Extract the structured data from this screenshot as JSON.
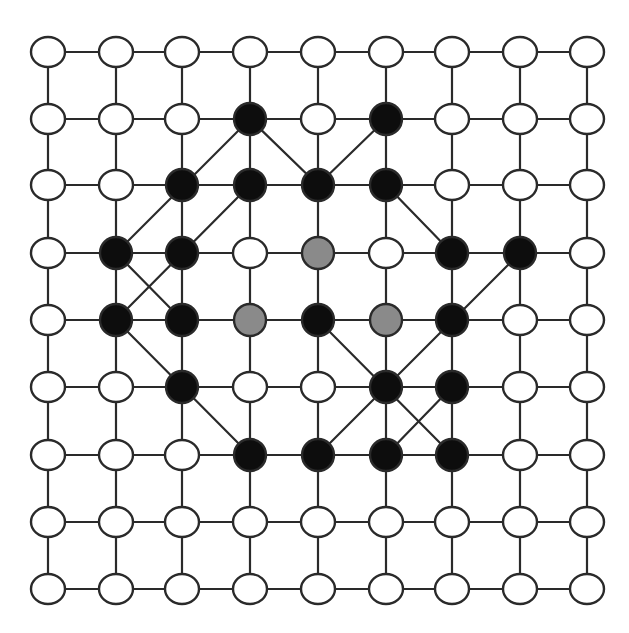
{
  "diagram": {
    "type": "grid-graph",
    "rows": 9,
    "cols": 9,
    "x_positions": [
      48,
      116,
      182,
      250,
      318,
      386,
      452,
      520,
      587
    ],
    "y_positions": [
      52,
      119,
      185,
      253,
      320,
      387,
      455,
      522,
      589
    ],
    "node_radius": 16,
    "colors": {
      "white": "#ffffff",
      "black": "#0d0d0d",
      "gray": "#8a8a8a",
      "stroke": "#2a2a2a"
    },
    "special_nodes": [
      {
        "row": 1,
        "col": 3,
        "state": "black"
      },
      {
        "row": 1,
        "col": 5,
        "state": "black"
      },
      {
        "row": 2,
        "col": 2,
        "state": "black"
      },
      {
        "row": 2,
        "col": 3,
        "state": "black"
      },
      {
        "row": 2,
        "col": 4,
        "state": "black"
      },
      {
        "row": 2,
        "col": 5,
        "state": "black"
      },
      {
        "row": 3,
        "col": 1,
        "state": "black"
      },
      {
        "row": 3,
        "col": 2,
        "state": "black"
      },
      {
        "row": 3,
        "col": 4,
        "state": "gray"
      },
      {
        "row": 3,
        "col": 6,
        "state": "black"
      },
      {
        "row": 3,
        "col": 7,
        "state": "black"
      },
      {
        "row": 4,
        "col": 1,
        "state": "black"
      },
      {
        "row": 4,
        "col": 2,
        "state": "black"
      },
      {
        "row": 4,
        "col": 3,
        "state": "gray"
      },
      {
        "row": 4,
        "col": 4,
        "state": "black"
      },
      {
        "row": 4,
        "col": 5,
        "state": "gray"
      },
      {
        "row": 4,
        "col": 6,
        "state": "black"
      },
      {
        "row": 5,
        "col": 2,
        "state": "black"
      },
      {
        "row": 5,
        "col": 5,
        "state": "black"
      },
      {
        "row": 5,
        "col": 6,
        "state": "black"
      },
      {
        "row": 6,
        "col": 3,
        "state": "black"
      },
      {
        "row": 6,
        "col": 4,
        "state": "black"
      },
      {
        "row": 6,
        "col": 5,
        "state": "black"
      },
      {
        "row": 6,
        "col": 6,
        "state": "black"
      }
    ],
    "diagonal_edges": [
      [
        [
          1,
          3
        ],
        [
          3,
          1
        ]
      ],
      [
        [
          1,
          3
        ],
        [
          2,
          4
        ]
      ],
      [
        [
          1,
          5
        ],
        [
          2,
          4
        ]
      ],
      [
        [
          2,
          3
        ],
        [
          4,
          1
        ]
      ],
      [
        [
          3,
          1
        ],
        [
          4,
          2
        ]
      ],
      [
        [
          2,
          5
        ],
        [
          3,
          6
        ]
      ],
      [
        [
          3,
          7
        ],
        [
          6,
          4
        ]
      ],
      [
        [
          4,
          1
        ],
        [
          6,
          3
        ]
      ],
      [
        [
          4,
          4
        ],
        [
          6,
          6
        ]
      ],
      [
        [
          5,
          6
        ],
        [
          6,
          5
        ]
      ]
    ]
  }
}
